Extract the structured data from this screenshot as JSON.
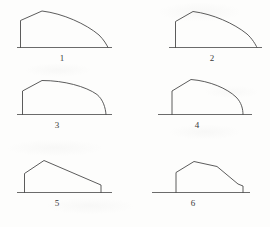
{
  "page": {
    "background_color": "#fdfdfc",
    "ink_color": "#4a4a4a",
    "label_color": "#3a3a3a",
    "width": 270,
    "height": 227,
    "columns": 2,
    "rows": 3
  },
  "figures": [
    {
      "id": "figure-1",
      "label": "1",
      "label_x": 62,
      "label_y": 61,
      "profile_type": "curved",
      "baseline": {
        "x1": 17,
        "y1": 47.5,
        "x2": 112,
        "y2": 47.5
      },
      "left_edge": {
        "x": 20.5,
        "y_top": 20.5,
        "y_bottom": 47.5
      },
      "peak": {
        "x": 42,
        "y": 11
      },
      "right_foot": {
        "x": 108,
        "y": 47.5
      },
      "outline_path": "M 20.5 47.5 L 20.5 20.5 L 42 11 C 63 13.5 86 24 99 35 C 104 40 106.5 44.5 108 47.5"
    },
    {
      "id": "figure-2",
      "label": "2",
      "label_x": 212,
      "label_y": 61,
      "profile_type": "curved",
      "baseline": {
        "x1": 169,
        "y1": 47.5,
        "x2": 262,
        "y2": 47.5
      },
      "left_edge": {
        "x": 175.5,
        "y_top": 21.5,
        "y_bottom": 47.5
      },
      "peak": {
        "x": 193,
        "y": 11.5
      },
      "right_foot": {
        "x": 257,
        "y": 47.5
      },
      "outline_path": "M 175.5 47.5 L 175.5 21.5 L 193 11.5 C 213 14 234 23.5 247 34 C 252.5 39 255.5 44.5 257 47.5"
    },
    {
      "id": "figure-3",
      "label": "3",
      "label_x": 57,
      "label_y": 128,
      "profile_type": "curved",
      "baseline": {
        "x1": 17,
        "y1": 114.5,
        "x2": 112,
        "y2": 114.5
      },
      "left_edge": {
        "x": 22.5,
        "y_top": 91,
        "y_bottom": 114.5
      },
      "peak": {
        "x": 42,
        "y": 80.5
      },
      "right_foot": {
        "x": 106,
        "y": 114.5
      },
      "outline_path": "M 22.5 114.5 L 22.5 91 L 42 80.5 C 64 80.5 86 86.5 97 94.5 C 103 99.5 105.5 107.5 106 114.5"
    },
    {
      "id": "figure-4",
      "label": "4",
      "label_x": 197,
      "label_y": 128,
      "profile_type": "curved",
      "baseline": {
        "x1": 158,
        "y1": 114.5,
        "x2": 252,
        "y2": 114.5
      },
      "left_edge": {
        "x": 172,
        "y_top": 91,
        "y_bottom": 114.5
      },
      "peak": {
        "x": 191,
        "y": 79.5
      },
      "right_foot": {
        "x": 243,
        "y": 114.5
      },
      "outline_path": "M 172 114.5 L 172 91 L 191 79.5 C 210 81 227 88.5 236 97 C 241.5 102.5 243 109 243 114.5"
    },
    {
      "id": "figure-5",
      "label": "5",
      "label_x": 57,
      "label_y": 206,
      "profile_type": "polygonal",
      "baseline": {
        "x1": 17,
        "y1": 192.5,
        "x2": 112,
        "y2": 192.5
      },
      "left_edge": {
        "x": 24.5,
        "y_top": 173.5,
        "y_bottom": 192.5
      },
      "peak": {
        "x": 44,
        "y": 160.5
      },
      "right_foot": {
        "x": 101,
        "y": 192.5
      },
      "vertices": [
        [
          24.5,
          192.5
        ],
        [
          24.5,
          173.5
        ],
        [
          44,
          160.5
        ],
        [
          101,
          185
        ],
        [
          101,
          192.5
        ]
      ],
      "outline_path": "M 24.5 192.5 L 24.5 173.5 L 44 160.5 L 101 185 L 101 192.5"
    },
    {
      "id": "figure-6",
      "label": "6",
      "label_x": 193,
      "label_y": 206,
      "profile_type": "polygonal",
      "baseline": {
        "x1": 152,
        "y1": 192.5,
        "x2": 250,
        "y2": 192.5
      },
      "left_edge": {
        "x": 176,
        "y_top": 172.5,
        "y_bottom": 192.5
      },
      "peak": {
        "x": 194,
        "y": 161.5
      },
      "right_foot": {
        "x": 243,
        "y": 192.5
      },
      "vertices": [
        [
          176,
          192.5
        ],
        [
          176,
          172.5
        ],
        [
          194,
          161.5
        ],
        [
          217,
          166.5
        ],
        [
          238,
          184
        ],
        [
          243,
          186
        ],
        [
          243,
          192.5
        ]
      ],
      "outline_path": "M 176 192.5 L 176 172.5 L 194 161.5 L 217 166.5 L 238 184 L 243 186 L 243 192.5"
    }
  ]
}
